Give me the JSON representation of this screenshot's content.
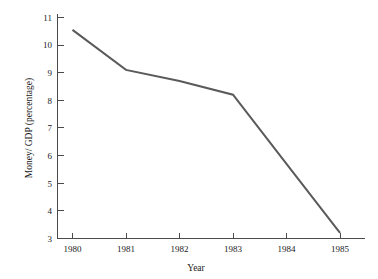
{
  "chart_data": {
    "type": "line",
    "title": "",
    "subtitle": "",
    "xlabel": "Year",
    "ylabel": "Money/ GDP (percentage)",
    "x": [
      1980,
      1981,
      1982,
      1983,
      1984,
      1985
    ],
    "categories": [
      "1980",
      "1981",
      "1982",
      "1983",
      "1984",
      "1985"
    ],
    "values": [
      10.55,
      9.1,
      8.7,
      8.2,
      5.7,
      3.2
    ],
    "series": [
      {
        "name": "Money/ GDP",
        "values": [
          10.55,
          9.1,
          8.7,
          8.2,
          5.7,
          3.2
        ],
        "color": "#5a5a5a"
      }
    ],
    "xlim": [
      1979.6,
      1985.5
    ],
    "ylim": [
      3,
      11
    ],
    "xticks": [
      "1980",
      "1981",
      "1982",
      "1983",
      "1984",
      "1985"
    ],
    "yticks": [
      "3",
      "4",
      "5",
      "6",
      "7",
      "8",
      "9",
      "10",
      "11"
    ],
    "grid": false,
    "legend": false,
    "legend_position": "none",
    "tick_direction": "in",
    "spines": [
      "left",
      "bottom"
    ]
  },
  "axes": {
    "y_label_text": "Money/ GDP (percentage)",
    "x_label_text": "Year"
  },
  "colors": {
    "line": "#5a5a5a",
    "axis": "#4a4a4a",
    "text": "#1a1a1a",
    "background": "#ffffff"
  }
}
